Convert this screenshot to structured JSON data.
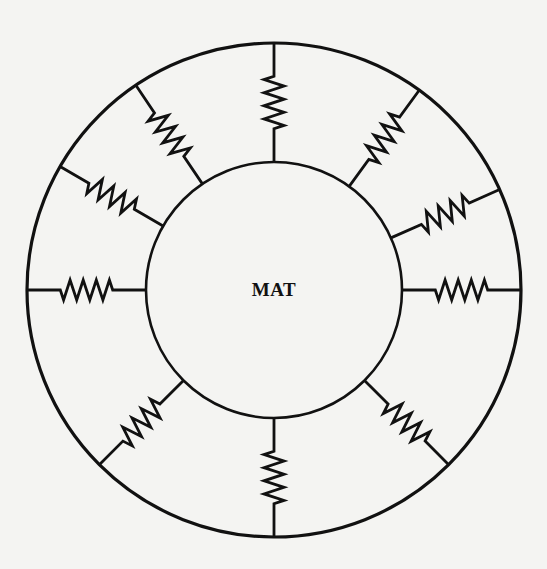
{
  "diagram": {
    "center_label": "MAT",
    "center": {
      "x": 274,
      "y": 290
    },
    "outer_radius": 247,
    "inner_radius": 128,
    "stroke_color": "#111111",
    "background_color": "#f4f4f2",
    "spring_count": 10,
    "spring_angles_deg": [
      0,
      36,
      66,
      90,
      135,
      180,
      225,
      270,
      300,
      326
    ],
    "spring_zigzag_peaks": 4
  }
}
